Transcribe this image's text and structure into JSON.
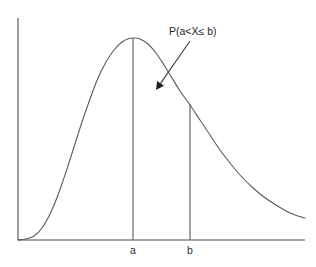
{
  "figure": {
    "title": "",
    "background_color": "#ffffff",
    "line_color": "#5a5a5a",
    "axis_color": "#4a4a4a",
    "text_color": "#1e1e1e"
  },
  "annotation": {
    "label": "P(a<X≤ b)",
    "arrow_from": "190,41",
    "arrow_to": "156,90"
  },
  "axis_labels": {
    "a": "a",
    "b": "b"
  },
  "chart_data": {
    "type": "line",
    "title": "",
    "subtitle": "",
    "xlabel": "",
    "ylabel": "",
    "grid": false,
    "legend": "none",
    "xlim": [
      0,
      100
    ],
    "ylim": [
      0,
      100
    ],
    "axis": {
      "x_axis_visible": true,
      "y_axis_visible": true,
      "x_axis_y_pixel": 240,
      "y_axis_x_pixel": 18,
      "x_axis_extent_pixels": [
        18,
        305
      ],
      "y_axis_extent_pixels": [
        18,
        240
      ],
      "ticks": []
    },
    "series": [
      {
        "name": "density",
        "type": "curve",
        "points": [
          [
            18,
            240
          ],
          [
            26,
            239
          ],
          [
            34,
            236
          ],
          [
            42,
            228
          ],
          [
            50,
            214
          ],
          [
            58,
            195
          ],
          [
            66,
            172
          ],
          [
            74,
            147
          ],
          [
            82,
            122
          ],
          [
            90,
            99
          ],
          [
            98,
            78
          ],
          [
            106,
            62
          ],
          [
            114,
            50
          ],
          [
            122,
            42
          ],
          [
            129,
            38.5
          ],
          [
            134,
            38
          ],
          [
            140,
            39
          ],
          [
            148,
            44
          ],
          [
            156,
            53
          ],
          [
            164,
            65
          ],
          [
            172,
            78
          ],
          [
            180,
            91
          ],
          [
            190,
            105
          ],
          [
            200,
            120
          ],
          [
            210,
            135
          ],
          [
            220,
            150
          ],
          [
            230,
            163
          ],
          [
            240,
            175
          ],
          [
            252,
            187
          ],
          [
            264,
            197
          ],
          [
            276,
            205
          ],
          [
            288,
            212
          ],
          [
            298,
            216
          ],
          [
            305,
            218
          ]
        ]
      }
    ],
    "markers": [
      {
        "label": "a",
        "x_pixel": 133,
        "y_top_pixel": 38,
        "y_bottom_pixel": 240,
        "note": "vertical line at the mode / peak of the density"
      },
      {
        "label": "b",
        "x_pixel": 190,
        "y_top_pixel": 104,
        "y_bottom_pixel": 240,
        "note": "vertical line on the right-hand descending tail"
      }
    ],
    "annotations": [
      {
        "text": "P(a<X≤ b)",
        "text_x_pixel": 169,
        "text_y_pixel": 35,
        "arrow_start_pixel": [
          190,
          41
        ],
        "arrow_end_pixel": [
          156,
          90
        ]
      }
    ]
  }
}
